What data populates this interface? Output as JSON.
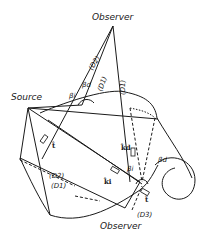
{
  "labels": {
    "observer_top": "Observer",
    "observer_bottom": "Observer",
    "source": "Source",
    "d2_top": "(D2)",
    "d1_top_a": "(D1)",
    "d1_top_b": "(D1)",
    "d2_bottom": "(D2)",
    "d1_bottom": "(D1)",
    "d3_bottom": "(D3)",
    "beta_i_top": "βi",
    "beta_d_top": "βd",
    "beta_i_bottom": "βi",
    "beta_d_bottom": "βd",
    "k_d": "k̂d",
    "k_i": "k̂i",
    "t_hat_left": "t̂",
    "t_hat_bottom": "t̂"
  },
  "colors": {
    "ink": "#1a1a1a",
    "background": "#ffffff"
  }
}
